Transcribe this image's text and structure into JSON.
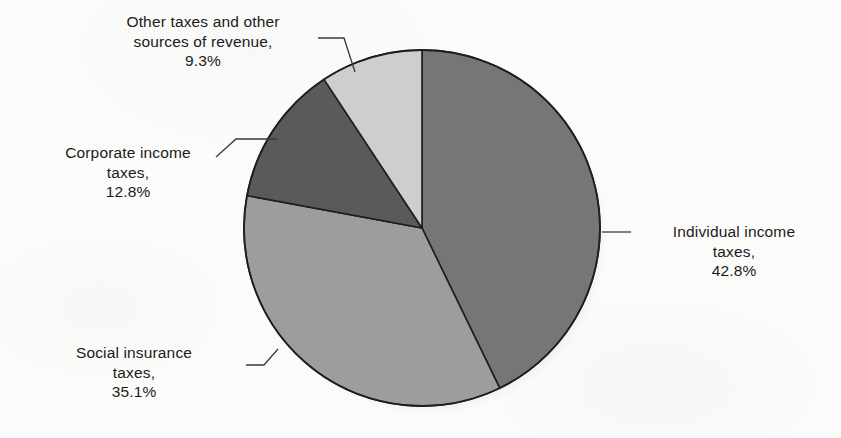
{
  "figure": {
    "background_color": "#fbfbfa",
    "text_color": "#1b1b1b",
    "line_color": "#3a3a3a"
  },
  "chart_data": {
    "type": "pie",
    "title": "",
    "subtitle": "",
    "xlabel": "",
    "ylabel": "",
    "legend_position": "none",
    "grid": false,
    "start_angle_deg": 0,
    "direction": "clockwise",
    "center_px": [
      422,
      228
    ],
    "radius_px": 178,
    "categories": [
      "Individual income taxes",
      "Social insurance taxes",
      "Corporate income taxes",
      "Other taxes and other sources of revenue"
    ],
    "values": [
      42.8,
      35.1,
      12.8,
      9.3
    ],
    "value_unit": "%",
    "slices": [
      {
        "name": "Individual income taxes",
        "value": 42.8,
        "value_text": "42.8%",
        "color": "#767676",
        "start_deg": 0.0,
        "end_deg": 154.1
      },
      {
        "name": "Social insurance taxes",
        "value": 35.1,
        "value_text": "35.1%",
        "color": "#9d9d9d",
        "start_deg": 154.1,
        "end_deg": 280.5
      },
      {
        "name": "Corporate income taxes",
        "value": 12.8,
        "value_text": "12.8%",
        "color": "#5a5a5a",
        "start_deg": 280.5,
        "end_deg": 326.6
      },
      {
        "name": "Other taxes and other sources of revenue",
        "value": 9.3,
        "value_text": "9.3%",
        "color": "#cecece",
        "start_deg": 326.6,
        "end_deg": 360.0
      }
    ]
  },
  "labels": {
    "individual": {
      "line1": "Individual income",
      "line2": "taxes,",
      "line3": "42.8%"
    },
    "social": {
      "line1": "Social insurance",
      "line2": "taxes,",
      "line3": "35.1%"
    },
    "corporate": {
      "line1": "Corporate income",
      "line2": "taxes,",
      "line3": "12.8%"
    },
    "other": {
      "line1": "Other taxes and other",
      "line2": "sources of revenue,",
      "line3": "9.3%"
    }
  }
}
